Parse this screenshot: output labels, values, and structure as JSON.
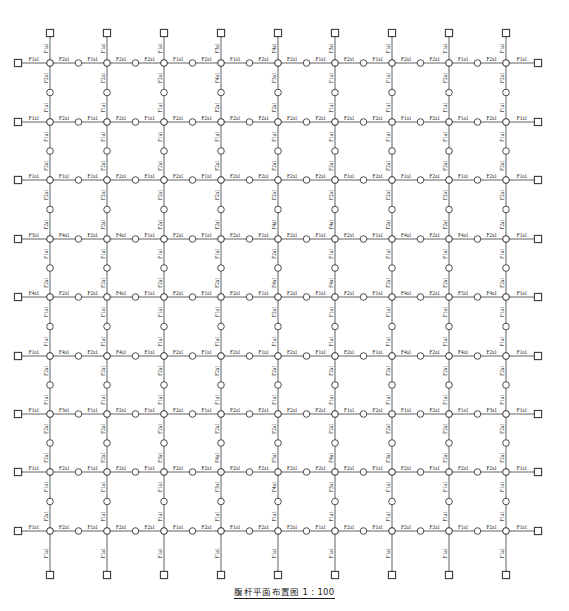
{
  "drawing": {
    "title": "腹杆平面布置图 1 : 100",
    "sheet_width": 569,
    "sheet_height": 611,
    "line_color": "#3a3a3a",
    "text_color": "#1a1a1a",
    "node_fill": "#ffffff"
  },
  "chart_data": {
    "type": "diagram",
    "title": "腹杆平面布置图 1 : 100",
    "scale": "1 : 100",
    "grid": {
      "columns_x": [
        50,
        107,
        164,
        221,
        278,
        335,
        392,
        449,
        506
      ],
      "rows_y": [
        63,
        122,
        180,
        239,
        297,
        356,
        414,
        472,
        531
      ],
      "stub_left_x": 18,
      "stub_right_x": 538,
      "stub_top_y": 33,
      "stub_bottom_y": 575
    },
    "node_types": {
      "square": "boundary-support-node",
      "circle": "web-member-joint-node"
    },
    "member_labels": [
      "F1a1",
      "F2a1",
      "F3a1",
      "F4a1",
      "F5a1"
    ],
    "horizontal_rows": [
      {
        "y": 63,
        "labels": [
          "F1a1",
          "F2a1",
          "F1a1",
          "F2a1",
          "F2a1",
          "F1a1",
          "F2a1",
          "F1a1",
          "F2a1",
          "F2a1",
          "F1a1",
          "F2a1",
          "F1a1",
          "F2a1",
          "F2a1",
          "F1a1",
          "F2a1",
          "F1a1"
        ]
      },
      {
        "y": 122,
        "labels": [
          "F1a1",
          "F2a1",
          "F1a1",
          "F2a1",
          "F1a1",
          "F2a1",
          "F2a1",
          "F2a1",
          "F2a1",
          "F2a1",
          "F2a1",
          "F2a1",
          "F2a1",
          "F1a1",
          "F2a1",
          "F1a1",
          "F2a1",
          "F1a1"
        ]
      },
      {
        "y": 180,
        "labels": [
          "F1a1",
          "F1a1",
          "F1a1",
          "F2a1",
          "F1a1",
          "F2a1",
          "F1a1",
          "F2a1",
          "F2a1",
          "F2a1",
          "F2a1",
          "F1a1",
          "F2a1",
          "F1a1",
          "F2a1",
          "F1a1",
          "F2a1",
          "F1a1"
        ]
      },
      {
        "y": 239,
        "labels": [
          "F3a1",
          "F4a1",
          "F2a1",
          "F4a1",
          "F1a1",
          "F2a1",
          "F1a1",
          "F2a1",
          "F1a1",
          "F2a1",
          "F1a1",
          "F2a1",
          "F1a1",
          "F4a1",
          "F2a1",
          "F4a1",
          "F2a1",
          "F1a1"
        ]
      },
      {
        "y": 297,
        "labels": [
          "F4a1",
          "F2a1",
          "F2a1",
          "F4a1",
          "F1a1",
          "F2a1",
          "F1a1",
          "F2a1",
          "F1a1",
          "F2a1",
          "F1a1",
          "F2a1",
          "F1a1",
          "F4a1",
          "F2a1",
          "F5a1",
          "F4a1",
          "F1a1"
        ]
      },
      {
        "y": 356,
        "labels": [
          "F1a1",
          "F4a1",
          "F2a1",
          "F4a1",
          "F1a1",
          "F2a1",
          "F1a1",
          "F2a1",
          "F1a1",
          "F2a1",
          "F1a1",
          "F2a1",
          "F1a1",
          "F4a1",
          "F2a1",
          "F4a1",
          "F2a1",
          "F1a1"
        ]
      },
      {
        "y": 414,
        "labels": [
          "F1a1",
          "F3a1",
          "F1a1",
          "F2a1",
          "F1a1",
          "F2a1",
          "F1a1",
          "F2a1",
          "F2a1",
          "F2a1",
          "F2a1",
          "F1a1",
          "F2a1",
          "F1a1",
          "F2a1",
          "F1a1",
          "F3a1",
          "F1a1"
        ]
      },
      {
        "y": 472,
        "labels": [
          "F1a1",
          "F2a1",
          "F1a1",
          "F2a1",
          "F1a1",
          "F2a1",
          "F2a1",
          "F2a1",
          "F2a1",
          "F2a1",
          "F2a1",
          "F2a1",
          "F1a1",
          "F2a1",
          "F1a1",
          "F2a1",
          "F2a1",
          "F1a1"
        ]
      },
      {
        "y": 531,
        "labels": [
          "F1a1",
          "F2a1",
          "F1a1",
          "F2a1",
          "F2a1",
          "F1a1",
          "F2a1",
          "F1a1",
          "F2a1",
          "F2a1",
          "F1a1",
          "F2a1",
          "F1a1",
          "F2a1",
          "F2a1",
          "F1a1",
          "F2a1",
          "F1a1"
        ]
      }
    ],
    "vertical_columns": [
      {
        "x": 50,
        "labels": [
          "F1a1",
          "F2a1",
          "F1a1",
          "F1a1",
          "F2a1",
          "F2a1",
          "F2a1",
          "F1a1",
          "F2a1",
          "F1a1",
          "F1a1",
          "F2a1",
          "F1a1",
          "F2a1",
          "F2a1",
          "F1a1",
          "F2a1",
          "F1a1"
        ]
      },
      {
        "x": 107,
        "labels": [
          "F1a1",
          "F2a1",
          "F1a1",
          "F1a1",
          "F2a1",
          "F2a1",
          "F2a1",
          "F1a1",
          "F2a1",
          "F1a1",
          "F1a1",
          "F2a1",
          "F1a1",
          "F2a1",
          "F2a1",
          "F1a1",
          "F1a1",
          "F1a1"
        ]
      },
      {
        "x": 164,
        "labels": [
          "F1a1",
          "F2a1",
          "F1a1",
          "F1a1",
          "F2a1",
          "F2a1",
          "F2a1",
          "F1a1",
          "F2a1",
          "F1a1",
          "F1a1",
          "F2a1",
          "F1a1",
          "F2a1",
          "F3a1",
          "F1a1",
          "F1a1",
          "F1a1"
        ]
      },
      {
        "x": 221,
        "labels": [
          "F3a1",
          "F4a1",
          "F2a1",
          "F1a1",
          "F2a1",
          "F2a1",
          "F2a1",
          "F1a1",
          "F2a1",
          "F1a1",
          "F1a1",
          "F2a1",
          "F1a1",
          "F2a1",
          "F4a1",
          "F3a1",
          "F1a1",
          "F1a1"
        ]
      },
      {
        "x": 278,
        "labels": [
          "F4a1",
          "F3a1",
          "F2a1",
          "F1a1",
          "F2a1",
          "F2a1",
          "F4a1",
          "F2a1",
          "F4a1",
          "F2a1",
          "F1a1",
          "F2a1",
          "F1a1",
          "F2a1",
          "F5a1",
          "F4a1",
          "F1a1",
          "F1a1"
        ]
      },
      {
        "x": 335,
        "labels": [
          "F3a1",
          "F1a1",
          "F1a1",
          "F1a1",
          "F2a1",
          "F2a1",
          "F4a1",
          "F1a1",
          "F4a1",
          "F1a1",
          "F1a1",
          "F2a1",
          "F1a1",
          "F2a1",
          "F4a1",
          "F3a1",
          "F1a1",
          "F1a1"
        ]
      },
      {
        "x": 392,
        "labels": [
          "F1a1",
          "F1a1",
          "F1a1",
          "F1a1",
          "F2a1",
          "F2a1",
          "F2a1",
          "F1a1",
          "F2a1",
          "F1a1",
          "F1a1",
          "F2a1",
          "F1a1",
          "F2a1",
          "F3a1",
          "F1a1",
          "F1a1",
          "F1a1"
        ]
      },
      {
        "x": 449,
        "labels": [
          "F1a1",
          "F2a1",
          "F1a1",
          "F1a1",
          "F2a1",
          "F2a1",
          "F2a1",
          "F1a1",
          "F2a1",
          "F1a1",
          "F1a1",
          "F2a1",
          "F1a1",
          "F2a1",
          "F2a1",
          "F1a1",
          "F1a1",
          "F1a1"
        ]
      },
      {
        "x": 506,
        "labels": [
          "F1a1",
          "F2a1",
          "F1a1",
          "F1a1",
          "F2a1",
          "F2a1",
          "F2a1",
          "F1a1",
          "F2a1",
          "F1a1",
          "F1a1",
          "F2a1",
          "F1a1",
          "F2a1",
          "F2a1",
          "F1a1",
          "F1a1",
          "F1a1"
        ]
      }
    ]
  }
}
